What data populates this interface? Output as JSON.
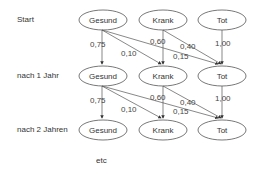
{
  "stages": [
    {
      "label": "Start"
    },
    {
      "label": "nach 1 Jahr"
    },
    {
      "label": "nach 2 Jahren"
    }
  ],
  "states": [
    "Gesund",
    "Krank",
    "Tot"
  ],
  "transitions": {
    "gesund_gesund": "0,75",
    "gesund_krank": "0,10",
    "gesund_tot": "0,15",
    "krank_krank": "0,60",
    "krank_tot": "0,40",
    "tot_tot": "1,00"
  },
  "footer": {
    "etc": "etc"
  }
}
